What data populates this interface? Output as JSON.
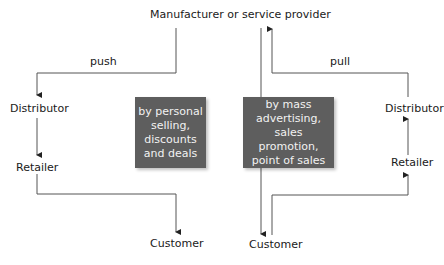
{
  "title": "Manufacturer or service provider",
  "push": {
    "label": "push",
    "distributor": "Distributor",
    "retailer": "Retailer",
    "customer": "Customer",
    "box_text": "by personal selling, discounts and deals",
    "box_lines": [
      "by personal",
      "selling,",
      "discounts",
      "and deals"
    ]
  },
  "pull": {
    "label": "pull",
    "distributor": "Distributor",
    "retailer": "Retailer",
    "customer": "Customer",
    "box_text": "by mass advertising, sales promotion, point of sales",
    "box_lines": [
      "by mass",
      "advertising,",
      "sales promotion,",
      "point of sales"
    ]
  },
  "colors": {
    "box_fill": "#5e5e5e",
    "box_text": "#f2f2f2",
    "line": "#555555"
  }
}
